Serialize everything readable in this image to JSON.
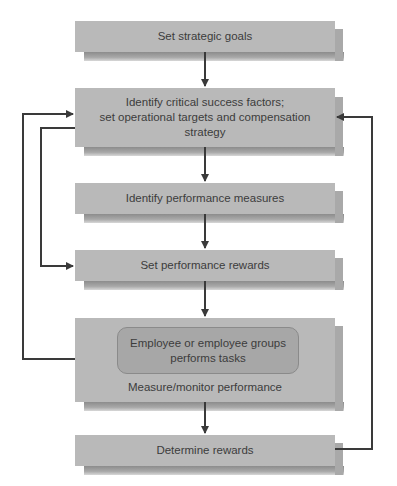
{
  "diagram": {
    "type": "flowchart",
    "colors": {
      "box_fill": "#b9b9b9",
      "inner_box_fill": "#a7a7a7",
      "arrow": "#3a3a3a",
      "text": "#3c3c3c"
    },
    "steps": [
      {
        "id": "set-strategic-goals",
        "label": "Set strategic goals"
      },
      {
        "id": "identify-csf",
        "label_lines": [
          "Identify critical success factors;",
          "set operational targets and compensation",
          "strategy"
        ]
      },
      {
        "id": "identify-performance-measures",
        "label": "Identify performance measures"
      },
      {
        "id": "set-performance-rewards",
        "label": "Set performance rewards"
      },
      {
        "id": "measure-monitor",
        "inner_label_lines": [
          "Employee or employee groups",
          "performs tasks"
        ],
        "label": "Measure/monitor performance"
      },
      {
        "id": "determine-rewards",
        "label": "Determine rewards"
      }
    ],
    "edges": [
      {
        "from": "set-strategic-goals",
        "to": "identify-csf"
      },
      {
        "from": "identify-csf",
        "to": "identify-performance-measures"
      },
      {
        "from": "identify-performance-measures",
        "to": "set-performance-rewards"
      },
      {
        "from": "set-performance-rewards",
        "to": "measure-monitor"
      },
      {
        "from": "measure-monitor",
        "to": "determine-rewards"
      },
      {
        "from": "identify-csf",
        "to": "set-performance-rewards",
        "route": "left-inner"
      },
      {
        "from": "measure-monitor",
        "to": "identify-csf",
        "route": "left-outer"
      },
      {
        "from": "determine-rewards",
        "to": "identify-csf",
        "route": "right"
      }
    ]
  }
}
